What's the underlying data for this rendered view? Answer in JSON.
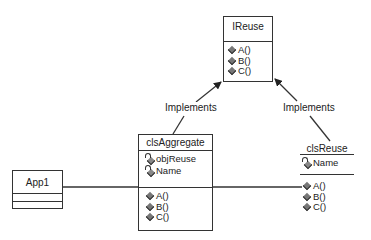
{
  "diagram": {
    "type": "UML class diagram",
    "classes": {
      "ireuse": {
        "name": "IReuse",
        "attributes": [],
        "methods": [
          "A()",
          "B()",
          "C()"
        ]
      },
      "clsaggregate": {
        "name": "clsAggregate",
        "attributes": [
          "objReuse",
          "Name"
        ],
        "methods": [
          "A()",
          "B()",
          "C()"
        ]
      },
      "clsreuse": {
        "name": "clsReuse",
        "attributes": [
          "Name"
        ],
        "methods": [
          "A()",
          "B()",
          "C()"
        ]
      },
      "app1": {
        "name": "App1",
        "attributes": [],
        "methods": []
      }
    },
    "relationships": [
      {
        "from": "clsAggregate",
        "to": "IReuse",
        "label": "Implements",
        "kind": "realization"
      },
      {
        "from": "clsReuse",
        "to": "IReuse",
        "label": "Implements",
        "kind": "realization"
      },
      {
        "from": "App1",
        "to": "clsReuse",
        "label": "",
        "kind": "association"
      }
    ],
    "colors": {
      "line": "#333333",
      "background": "#ffffff",
      "icon": "#777777"
    }
  }
}
